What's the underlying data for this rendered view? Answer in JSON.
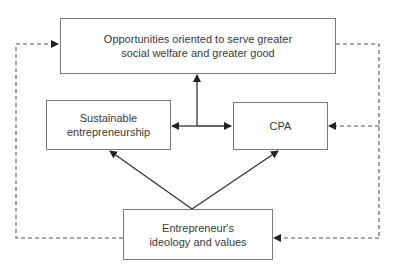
{
  "diagram": {
    "nodes": {
      "opportunities": {
        "lines": [
          "Opportunities oriented to serve greater",
          "social welfare and greater good"
        ]
      },
      "sustainable": {
        "lines": [
          "Sustainable",
          "entrepreneurship"
        ]
      },
      "cpa": {
        "lines": [
          "CPA"
        ]
      },
      "ideology": {
        "lines": [
          "Entrepreneur's",
          "ideology and values"
        ]
      }
    },
    "edges": [
      {
        "from": "sustainable-cpa-junction",
        "to": "opportunities",
        "style": "solid"
      },
      {
        "from": "junction",
        "to": "sustainable",
        "style": "solid"
      },
      {
        "from": "junction",
        "to": "cpa",
        "style": "solid"
      },
      {
        "from": "ideology",
        "to": "sustainable",
        "style": "solid"
      },
      {
        "from": "ideology",
        "to": "cpa",
        "style": "solid"
      },
      {
        "from": "ideology",
        "to": "opportunities",
        "style": "dashed",
        "route": "left"
      },
      {
        "from": "opportunities",
        "to": "cpa",
        "style": "dashed",
        "route": "right"
      },
      {
        "from": "opportunities",
        "to": "ideology",
        "style": "dashed",
        "route": "right"
      }
    ],
    "colors": {
      "line": "#333333",
      "dashed": "#555555",
      "border": "#7a7a7a"
    }
  }
}
